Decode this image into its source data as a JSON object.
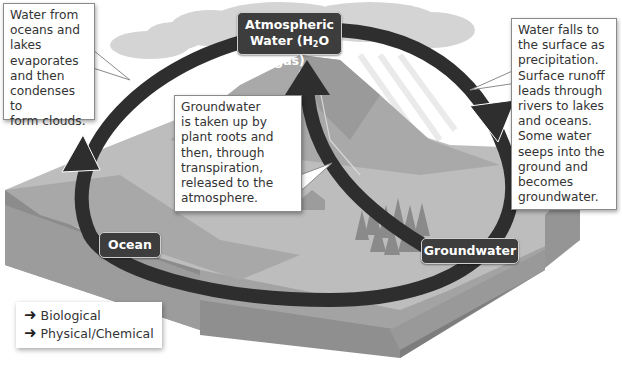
{
  "diagram": {
    "type": "water-cycle",
    "nodes": {
      "atmospheric": {
        "line1": "Atmospheric",
        "line2_prefix": "Water (H",
        "line2_sub": "2",
        "line2_suffix": "O gas)"
      },
      "ocean": {
        "label": "Ocean"
      },
      "groundwater": {
        "label": "Groundwater"
      }
    },
    "callouts": {
      "evaporation": {
        "lines": [
          "Water from",
          "oceans and",
          "lakes",
          "evaporates",
          "and then",
          "condenses to",
          "form clouds."
        ]
      },
      "precipitation": {
        "lines": [
          "Water falls to",
          "the surface as",
          "precipitation.",
          "Surface runoff",
          "leads through",
          "rivers to lakes",
          "and oceans.",
          "Some water",
          "seeps into the",
          "ground and",
          "becomes",
          "groundwater."
        ]
      },
      "transpiration": {
        "lines": [
          "Groundwater",
          "is taken up by",
          "plant roots and",
          "then, through",
          "transpiration,",
          "released to the",
          "atmosphere."
        ]
      }
    },
    "legend": {
      "items": [
        {
          "icon": "arrow-right-icon",
          "label": "Biological"
        },
        {
          "icon": "arrow-right-icon",
          "label": "Physical/Chemical"
        }
      ]
    },
    "colors": {
      "arrow": "#2e2e2e",
      "node_bg": "#3d3d3d",
      "terrain_top": "#bdbdbd",
      "terrain_side": "#9e9e9e",
      "mountain": "#a8a8a8",
      "cloud": "#d6d6d6"
    }
  }
}
